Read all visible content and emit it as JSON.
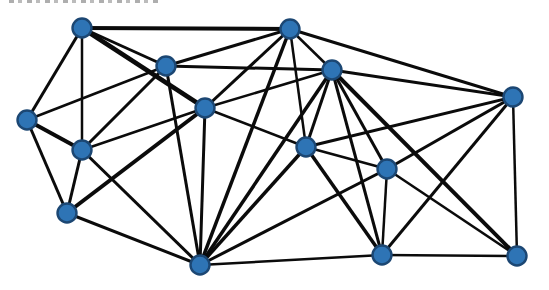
{
  "page": {
    "background_color": "#ffffff",
    "width": 549,
    "height": 290
  },
  "cropped_text_remnant": {
    "present": true,
    "legible": false
  },
  "chart_data": {
    "type": "graph",
    "title": "",
    "node_style": {
      "fill": "#2E74B5",
      "stroke": "#1C4773",
      "stroke_width": 2.4,
      "radius": 9.5
    },
    "edge_style": {
      "color": "#0b0b0b",
      "default_width": 3
    },
    "nodes": [
      {
        "id": "n1",
        "x": 82,
        "y": 28
      },
      {
        "id": "n2",
        "x": 166,
        "y": 66
      },
      {
        "id": "n3",
        "x": 290,
        "y": 29
      },
      {
        "id": "n4",
        "x": 332,
        "y": 70
      },
      {
        "id": "n5",
        "x": 513,
        "y": 97
      },
      {
        "id": "n6",
        "x": 205,
        "y": 108
      },
      {
        "id": "n7",
        "x": 27,
        "y": 120
      },
      {
        "id": "n8",
        "x": 82,
        "y": 150
      },
      {
        "id": "n9",
        "x": 306,
        "y": 147
      },
      {
        "id": "n10",
        "x": 387,
        "y": 169
      },
      {
        "id": "n11",
        "x": 67,
        "y": 213
      },
      {
        "id": "n12",
        "x": 200,
        "y": 265
      },
      {
        "id": "n13",
        "x": 382,
        "y": 255
      },
      {
        "id": "n14",
        "x": 517,
        "y": 256
      }
    ],
    "edges": [
      {
        "source": "n1",
        "target": "n3",
        "width": 4
      },
      {
        "source": "n1",
        "target": "n2",
        "width": 3
      },
      {
        "source": "n1",
        "target": "n6",
        "width": 4.5
      },
      {
        "source": "n1",
        "target": "n7",
        "width": 3
      },
      {
        "source": "n1",
        "target": "n8",
        "width": 2.5
      },
      {
        "source": "n2",
        "target": "n3",
        "width": 3
      },
      {
        "source": "n2",
        "target": "n7",
        "width": 2.5
      },
      {
        "source": "n2",
        "target": "n8",
        "width": 3
      },
      {
        "source": "n2",
        "target": "n12",
        "width": 3
      },
      {
        "source": "n3",
        "target": "n6",
        "width": 3
      },
      {
        "source": "n3",
        "target": "n12",
        "width": 3.5
      },
      {
        "source": "n3",
        "target": "n9",
        "width": 2.5
      },
      {
        "source": "n3",
        "target": "n4",
        "width": 2.5
      },
      {
        "source": "n3",
        "target": "n5",
        "width": 3
      },
      {
        "source": "n4",
        "target": "n2",
        "width": 3
      },
      {
        "source": "n4",
        "target": "n6",
        "width": 2.5
      },
      {
        "source": "n4",
        "target": "n9",
        "width": 3
      },
      {
        "source": "n4",
        "target": "n12",
        "width": 3.5
      },
      {
        "source": "n4",
        "target": "n13",
        "width": 3
      },
      {
        "source": "n4",
        "target": "n10",
        "width": 3
      },
      {
        "source": "n4",
        "target": "n14",
        "width": 4
      },
      {
        "source": "n4",
        "target": "n5",
        "width": 3
      },
      {
        "source": "n6",
        "target": "n8",
        "width": 2.5
      },
      {
        "source": "n6",
        "target": "n11",
        "width": 4
      },
      {
        "source": "n6",
        "target": "n12",
        "width": 3
      },
      {
        "source": "n6",
        "target": "n9",
        "width": 2.5
      },
      {
        "source": "n7",
        "target": "n8",
        "width": 4
      },
      {
        "source": "n7",
        "target": "n11",
        "width": 3
      },
      {
        "source": "n8",
        "target": "n11",
        "width": 3
      },
      {
        "source": "n8",
        "target": "n12",
        "width": 3
      },
      {
        "source": "n11",
        "target": "n12",
        "width": 3
      },
      {
        "source": "n12",
        "target": "n9",
        "width": 3.5
      },
      {
        "source": "n12",
        "target": "n10",
        "width": 3
      },
      {
        "source": "n12",
        "target": "n13",
        "width": 2.5
      },
      {
        "source": "n9",
        "target": "n5",
        "width": 3
      },
      {
        "source": "n9",
        "target": "n10",
        "width": 2.5
      },
      {
        "source": "n9",
        "target": "n13",
        "width": 3.5
      },
      {
        "source": "n10",
        "target": "n5",
        "width": 3
      },
      {
        "source": "n10",
        "target": "n13",
        "width": 2.5
      },
      {
        "source": "n10",
        "target": "n14",
        "width": 2.5
      },
      {
        "source": "n13",
        "target": "n5",
        "width": 3
      },
      {
        "source": "n13",
        "target": "n14",
        "width": 2.5
      },
      {
        "source": "n14",
        "target": "n5",
        "width": 2.5
      }
    ]
  }
}
